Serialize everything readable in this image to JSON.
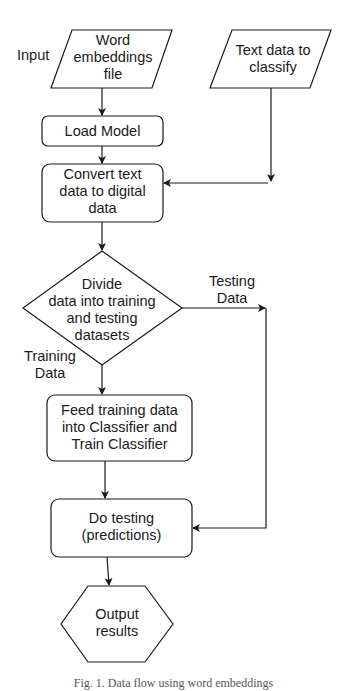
{
  "diagram": {
    "type": "flowchart",
    "nodes": {
      "word_embeddings": {
        "shape": "parallelogram",
        "label": "Word embeddings file",
        "lines": [
          "Word",
          "embeddings",
          "file"
        ]
      },
      "text_data": {
        "shape": "parallelogram",
        "label": "Text data to classify",
        "lines": [
          "Text data to",
          "classify"
        ]
      },
      "load_model": {
        "shape": "rounded-rect",
        "label": "Load Model"
      },
      "convert": {
        "shape": "rounded-rect",
        "label": "Convert text data to digital data",
        "lines": [
          "Convert text",
          "data to digital",
          "data"
        ]
      },
      "divide": {
        "shape": "diamond",
        "label": "Divide data into training and testing datasets",
        "lines": [
          "Divide",
          "data into training",
          "and testing",
          "datasets"
        ]
      },
      "feed": {
        "shape": "rounded-rect",
        "label": "Feed training data into Classifier and Train Classifier",
        "lines": [
          "Feed training data",
          "into Classifier and",
          "Train Classifier"
        ]
      },
      "testing": {
        "shape": "rounded-rect",
        "label": "Do testing (predictions)",
        "lines": [
          "Do testing",
          "(predictions)"
        ]
      },
      "output": {
        "shape": "hexagon",
        "label": "Output results",
        "lines": [
          "Output",
          "results"
        ]
      }
    },
    "edge_labels": {
      "input": "Input",
      "testing_data": [
        "Testing",
        "Data"
      ],
      "training_data": [
        "Training",
        "Data"
      ]
    },
    "edges": [
      {
        "from": "word_embeddings",
        "to": "load_model"
      },
      {
        "from": "load_model",
        "to": "convert"
      },
      {
        "from": "text_data",
        "to": "convert"
      },
      {
        "from": "convert",
        "to": "divide"
      },
      {
        "from": "divide",
        "to": "feed",
        "label": "Training Data"
      },
      {
        "from": "divide",
        "to": "testing",
        "label": "Testing Data"
      },
      {
        "from": "feed",
        "to": "testing"
      },
      {
        "from": "testing",
        "to": "output"
      }
    ],
    "caption": "Fig. 1. Data flow using word embeddings"
  }
}
